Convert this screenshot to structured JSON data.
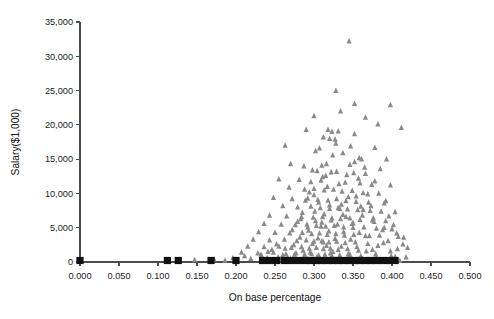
{
  "chart_data": {
    "type": "scatter",
    "title": "",
    "xlabel": "On base percentage",
    "ylabel": "Salary($1,000)",
    "xlim": [
      0.0,
      0.5
    ],
    "ylim": [
      0,
      35000
    ],
    "grid": false,
    "legend": "none",
    "x_ticks": [
      "0.000",
      "0.050",
      "0.100",
      "0.150",
      "0.200",
      "0.250",
      "0.300",
      "0.350",
      "0.400",
      "0.450",
      "0.500"
    ],
    "x_tick_values": [
      0.0,
      0.05,
      0.1,
      0.15,
      0.2,
      0.25,
      0.3,
      0.35,
      0.4,
      0.45,
      0.5
    ],
    "y_ticks": [
      "0",
      "5,000",
      "10,000",
      "15,000",
      "20,000",
      "25,000",
      "30,000",
      "35,000"
    ],
    "y_tick_values": [
      0,
      5000,
      10000,
      15000,
      20000,
      25000,
      30000,
      35000
    ],
    "series": [
      {
        "name": "salary-markers",
        "marker": "triangle",
        "color": "#8a8a8a",
        "points": [
          [
            0.345,
            32200
          ],
          [
            0.328,
            25000
          ],
          [
            0.352,
            23100
          ],
          [
            0.398,
            22900
          ],
          [
            0.334,
            22000
          ],
          [
            0.3,
            21300
          ],
          [
            0.366,
            21100
          ],
          [
            0.382,
            20100
          ],
          [
            0.412,
            19600
          ],
          [
            0.29,
            19300
          ],
          [
            0.318,
            19300
          ],
          [
            0.323,
            19000
          ],
          [
            0.331,
            19100
          ],
          [
            0.352,
            18700
          ],
          [
            0.312,
            18200
          ],
          [
            0.32,
            18000
          ],
          [
            0.327,
            17900
          ],
          [
            0.263,
            17000
          ],
          [
            0.378,
            16700
          ],
          [
            0.302,
            16200
          ],
          [
            0.337,
            15900
          ],
          [
            0.358,
            15200
          ],
          [
            0.361,
            15000
          ],
          [
            0.393,
            15000
          ],
          [
            0.27,
            14300
          ],
          [
            0.287,
            14000
          ],
          [
            0.31,
            14100
          ],
          [
            0.316,
            14300
          ],
          [
            0.346,
            14200
          ],
          [
            0.304,
            13300
          ],
          [
            0.322,
            13100
          ],
          [
            0.329,
            13200
          ],
          [
            0.351,
            13000
          ],
          [
            0.366,
            12900
          ],
          [
            0.255,
            12100
          ],
          [
            0.281,
            12000
          ],
          [
            0.296,
            11700
          ],
          [
            0.309,
            11900
          ],
          [
            0.34,
            11600
          ],
          [
            0.359,
            11500
          ],
          [
            0.374,
            11300
          ],
          [
            0.398,
            11200
          ],
          [
            0.268,
            10900
          ],
          [
            0.288,
            10600
          ],
          [
            0.3,
            10700
          ],
          [
            0.313,
            10500
          ],
          [
            0.325,
            10600
          ],
          [
            0.336,
            10300
          ],
          [
            0.349,
            10400
          ],
          [
            0.363,
            10100
          ],
          [
            0.383,
            10000
          ],
          [
            0.248,
            9400
          ],
          [
            0.272,
            9200
          ],
          [
            0.292,
            9300
          ],
          [
            0.305,
            9100
          ],
          [
            0.318,
            9000
          ],
          [
            0.329,
            9200
          ],
          [
            0.341,
            8900
          ],
          [
            0.354,
            8800
          ],
          [
            0.37,
            8700
          ],
          [
            0.39,
            8600
          ],
          [
            0.26,
            8200
          ],
          [
            0.279,
            8000
          ],
          [
            0.296,
            8100
          ],
          [
            0.308,
            7900
          ],
          [
            0.32,
            7800
          ],
          [
            0.331,
            7900
          ],
          [
            0.343,
            7700
          ],
          [
            0.356,
            7600
          ],
          [
            0.372,
            7500
          ],
          [
            0.386,
            7400
          ],
          [
            0.404,
            7300
          ],
          [
            0.243,
            6800
          ],
          [
            0.265,
            6700
          ],
          [
            0.284,
            6600
          ],
          [
            0.299,
            6500
          ],
          [
            0.311,
            6600
          ],
          [
            0.323,
            6400
          ],
          [
            0.334,
            6300
          ],
          [
            0.346,
            6400
          ],
          [
            0.359,
            6200
          ],
          [
            0.375,
            6100
          ],
          [
            0.392,
            6000
          ],
          [
            0.236,
            5600
          ],
          [
            0.258,
            5500
          ],
          [
            0.276,
            5400
          ],
          [
            0.291,
            5500
          ],
          [
            0.303,
            5300
          ],
          [
            0.315,
            5200
          ],
          [
            0.326,
            5300
          ],
          [
            0.338,
            5100
          ],
          [
            0.35,
            5000
          ],
          [
            0.364,
            5100
          ],
          [
            0.38,
            4900
          ],
          [
            0.4,
            4800
          ],
          [
            0.229,
            4400
          ],
          [
            0.25,
            4300
          ],
          [
            0.269,
            4200
          ],
          [
            0.285,
            4300
          ],
          [
            0.297,
            4100
          ],
          [
            0.307,
            4200
          ],
          [
            0.317,
            4000
          ],
          [
            0.328,
            4100
          ],
          [
            0.339,
            3900
          ],
          [
            0.351,
            4000
          ],
          [
            0.366,
            3800
          ],
          [
            0.384,
            3900
          ],
          [
            0.408,
            3700
          ],
          [
            0.222,
            3300
          ],
          [
            0.243,
            3200
          ],
          [
            0.262,
            3300
          ],
          [
            0.278,
            3100
          ],
          [
            0.29,
            3200
          ],
          [
            0.3,
            3000
          ],
          [
            0.31,
            3100
          ],
          [
            0.319,
            2900
          ],
          [
            0.329,
            3000
          ],
          [
            0.34,
            2800
          ],
          [
            0.353,
            2900
          ],
          [
            0.369,
            2700
          ],
          [
            0.389,
            2800
          ],
          [
            0.414,
            2600
          ],
          [
            0.215,
            2300
          ],
          [
            0.236,
            2200
          ],
          [
            0.255,
            2300
          ],
          [
            0.271,
            2100
          ],
          [
            0.284,
            2200
          ],
          [
            0.294,
            2000
          ],
          [
            0.303,
            2100
          ],
          [
            0.312,
            1900
          ],
          [
            0.321,
            2000
          ],
          [
            0.331,
            1800
          ],
          [
            0.343,
            1900
          ],
          [
            0.357,
            1700
          ],
          [
            0.375,
            1800
          ],
          [
            0.398,
            1600
          ],
          [
            0.207,
            1400
          ],
          [
            0.228,
            1300
          ],
          [
            0.248,
            1400
          ],
          [
            0.264,
            1200
          ],
          [
            0.277,
            1300
          ],
          [
            0.288,
            1100
          ],
          [
            0.297,
            1200
          ],
          [
            0.306,
            1000
          ],
          [
            0.314,
            1100
          ],
          [
            0.323,
            900
          ],
          [
            0.333,
            1000
          ],
          [
            0.345,
            800
          ],
          [
            0.36,
            900
          ],
          [
            0.38,
            700
          ],
          [
            0.404,
            800
          ],
          [
            0.196,
            600
          ],
          [
            0.219,
            500
          ],
          [
            0.24,
            600
          ],
          [
            0.257,
            400
          ],
          [
            0.27,
            500
          ],
          [
            0.281,
            350
          ],
          [
            0.291,
            450
          ],
          [
            0.299,
            300
          ],
          [
            0.308,
            400
          ],
          [
            0.316,
            250
          ],
          [
            0.325,
            350
          ],
          [
            0.336,
            200
          ],
          [
            0.348,
            300
          ],
          [
            0.364,
            200
          ],
          [
            0.386,
            250
          ],
          [
            0.41,
            200
          ],
          [
            0.147,
            300
          ],
          [
            0.172,
            400
          ],
          [
            0.186,
            250
          ],
          [
            0.211,
            900
          ],
          [
            0.232,
            1100
          ],
          [
            0.246,
            1800
          ],
          [
            0.252,
            2600
          ],
          [
            0.26,
            1000
          ],
          [
            0.266,
            700
          ],
          [
            0.274,
            2500
          ],
          [
            0.282,
            3600
          ],
          [
            0.286,
            1700
          ],
          [
            0.293,
            4600
          ],
          [
            0.298,
            2700
          ],
          [
            0.302,
            6000
          ],
          [
            0.305,
            3500
          ],
          [
            0.309,
            5200
          ],
          [
            0.313,
            7000
          ],
          [
            0.316,
            2400
          ],
          [
            0.319,
            4500
          ],
          [
            0.322,
            6100
          ],
          [
            0.324,
            1500
          ],
          [
            0.327,
            3400
          ],
          [
            0.33,
            5500
          ],
          [
            0.333,
            7800
          ],
          [
            0.335,
            2300
          ],
          [
            0.338,
            4400
          ],
          [
            0.341,
            6600
          ],
          [
            0.344,
            1200
          ],
          [
            0.347,
            3300
          ],
          [
            0.35,
            5700
          ],
          [
            0.355,
            2200
          ],
          [
            0.358,
            4300
          ],
          [
            0.362,
            6800
          ],
          [
            0.367,
            1600
          ],
          [
            0.371,
            3800
          ],
          [
            0.377,
            5900
          ],
          [
            0.382,
            2400
          ],
          [
            0.388,
            4700
          ],
          [
            0.395,
            3100
          ],
          [
            0.402,
            5400
          ],
          [
            0.407,
            1900
          ],
          [
            0.415,
            3600
          ],
          [
            0.42,
            2100
          ],
          [
            0.3,
            9800
          ],
          [
            0.311,
            12400
          ],
          [
            0.324,
            15600
          ],
          [
            0.335,
            8400
          ],
          [
            0.342,
            12700
          ],
          [
            0.354,
            9600
          ],
          [
            0.365,
            13800
          ],
          [
            0.373,
            8200
          ],
          [
            0.285,
            7200
          ],
          [
            0.294,
            10200
          ],
          [
            0.307,
            16600
          ],
          [
            0.317,
            11000
          ],
          [
            0.328,
            17300
          ],
          [
            0.347,
            16900
          ],
          [
            0.357,
            12200
          ],
          [
            0.369,
            9900
          ],
          [
            0.385,
            13600
          ],
          [
            0.392,
            8900
          ],
          [
            0.279,
            5900
          ],
          [
            0.289,
            9000
          ],
          [
            0.298,
            13400
          ],
          [
            0.306,
            8700
          ],
          [
            0.315,
            12600
          ],
          [
            0.332,
            11400
          ],
          [
            0.344,
            9500
          ],
          [
            0.352,
            14600
          ],
          [
            0.363,
            7600
          ],
          [
            0.378,
            11800
          ],
          [
            0.396,
            6700
          ],
          [
            0.272,
            4700
          ],
          [
            0.283,
            6300
          ],
          [
            0.292,
            5100
          ],
          [
            0.301,
            7400
          ],
          [
            0.31,
            5800
          ],
          [
            0.32,
            8300
          ],
          [
            0.337,
            6900
          ],
          [
            0.349,
            5600
          ],
          [
            0.36,
            8100
          ],
          [
            0.376,
            6400
          ],
          [
            0.39,
            5000
          ],
          [
            0.406,
            4200
          ],
          [
            0.233,
            900
          ],
          [
            0.241,
            1500
          ],
          [
            0.254,
            700
          ],
          [
            0.263,
            2000
          ],
          [
            0.275,
            1100
          ],
          [
            0.287,
            600
          ],
          [
            0.295,
            1400
          ],
          [
            0.304,
            800
          ],
          [
            0.312,
            2900
          ],
          [
            0.321,
            1300
          ],
          [
            0.334,
            700
          ],
          [
            0.346,
            1100
          ],
          [
            0.361,
            600
          ],
          [
            0.379,
            1200
          ],
          [
            0.399,
            900
          ],
          [
            0.418,
            700
          ]
        ]
      },
      {
        "name": "baseline-markers",
        "marker": "square",
        "color": "#111111",
        "points": [
          [
            0.0,
            0
          ],
          [
            0.112,
            0
          ],
          [
            0.126,
            0
          ],
          [
            0.168,
            0
          ],
          [
            0.2,
            0
          ],
          [
            0.234,
            0
          ],
          [
            0.243,
            0
          ],
          [
            0.252,
            0
          ],
          [
            0.262,
            0
          ],
          [
            0.271,
            0
          ],
          [
            0.28,
            0
          ],
          [
            0.289,
            0
          ],
          [
            0.296,
            0
          ],
          [
            0.303,
            0
          ],
          [
            0.31,
            0
          ],
          [
            0.317,
            0
          ],
          [
            0.324,
            0
          ],
          [
            0.331,
            0
          ],
          [
            0.338,
            0
          ],
          [
            0.345,
            0
          ],
          [
            0.352,
            0
          ],
          [
            0.359,
            0
          ],
          [
            0.366,
            0
          ],
          [
            0.373,
            0
          ],
          [
            0.38,
            0
          ],
          [
            0.388,
            0
          ],
          [
            0.396,
            0
          ],
          [
            0.404,
            0
          ]
        ]
      }
    ]
  }
}
